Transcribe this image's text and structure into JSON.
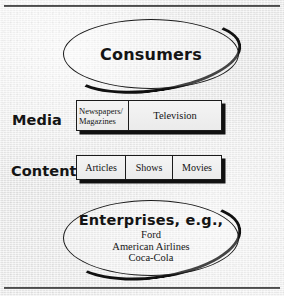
{
  "figure": {
    "background_color": "#e8e8e8",
    "ink_color": "#141414",
    "rules": {
      "top_label": "top-rule",
      "bottom_label": "bottom-rule"
    }
  },
  "consumers": {
    "title": "Consumers"
  },
  "rows": [
    {
      "label": "Media",
      "cells": [
        {
          "line1": "Newspapers/",
          "line2": "Magazines"
        },
        {
          "line1": "Television",
          "line2": ""
        }
      ]
    },
    {
      "label": "Content",
      "cells": [
        {
          "line1": "Articles",
          "line2": ""
        },
        {
          "line1": "Shows",
          "line2": ""
        },
        {
          "line1": "Movies",
          "line2": ""
        }
      ]
    }
  ],
  "enterprises": {
    "title": "Enterprises, e.g.,",
    "examples": [
      "Ford",
      "American Airlines",
      "Coca-Cola"
    ]
  }
}
